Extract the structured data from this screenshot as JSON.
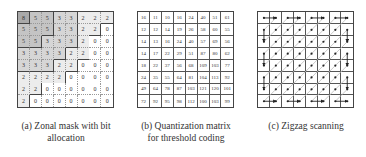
{
  "panels": {
    "a": {
      "caption": "(a)  Zonal mask with bit allocation",
      "caption_line1": "(a)  Zonal mask with bit",
      "caption_line2": "allocation",
      "matrix": [
        [
          8,
          5,
          5,
          3,
          3,
          2,
          2,
          2
        ],
        [
          5,
          5,
          5,
          3,
          3,
          2,
          2,
          0
        ],
        [
          5,
          5,
          3,
          3,
          3,
          2,
          0,
          0
        ],
        [
          3,
          3,
          3,
          3,
          2,
          2,
          0,
          0
        ],
        [
          3,
          3,
          3,
          2,
          2,
          0,
          0,
          0
        ],
        [
          2,
          2,
          2,
          2,
          0,
          0,
          0,
          0
        ],
        [
          2,
          2,
          0,
          0,
          0,
          0,
          0,
          0
        ],
        [
          2,
          0,
          0,
          0,
          0,
          0,
          0,
          0
        ]
      ],
      "shade_colors": {
        "8": "#a9a9a9",
        "5": "#c4c4c4",
        "3": "#d6d6d6",
        "2": "#ececec",
        "0": "#ffffff"
      }
    },
    "b": {
      "caption_line1": "(b)  Quantization matrix",
      "caption_line2": "for threshold coding",
      "matrix": [
        [
          16,
          11,
          10,
          16,
          24,
          40,
          51,
          61
        ],
        [
          12,
          12,
          14,
          19,
          26,
          58,
          60,
          55
        ],
        [
          14,
          13,
          16,
          24,
          40,
          57,
          69,
          56
        ],
        [
          14,
          17,
          22,
          29,
          51,
          87,
          80,
          62
        ],
        [
          18,
          22,
          37,
          56,
          68,
          109,
          103,
          77
        ],
        [
          24,
          35,
          55,
          64,
          81,
          104,
          113,
          92
        ],
        [
          49,
          64,
          78,
          87,
          103,
          121,
          120,
          101
        ],
        [
          72,
          92,
          95,
          98,
          112,
          100,
          103,
          99
        ]
      ]
    },
    "c": {
      "caption_line1": "(c)  Zigzag scanning",
      "size": 8
    }
  }
}
